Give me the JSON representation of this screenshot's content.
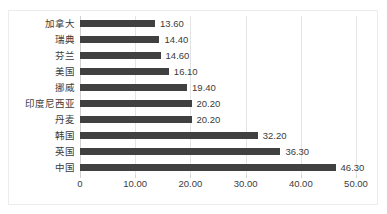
{
  "chart_data": {
    "type": "bar",
    "orientation": "horizontal",
    "title": "",
    "xlabel": "",
    "ylabel": "",
    "categories": [
      "加拿大",
      "瑞典",
      "芬兰",
      "美国",
      "挪威",
      "印度尼西亚",
      "丹麦",
      "韩国",
      "英国",
      "中国"
    ],
    "values": [
      13.6,
      14.4,
      14.6,
      16.1,
      19.4,
      20.2,
      20.2,
      32.2,
      36.3,
      46.3
    ],
    "value_labels": [
      "13.60",
      "14.40",
      "14.60",
      "16.10",
      "19.40",
      "20.20",
      "20.20",
      "32.20",
      "36.30",
      "46.30"
    ],
    "xlim": [
      0,
      50
    ],
    "xticks": [
      0,
      10,
      20,
      30,
      40,
      50
    ],
    "xtick_labels": [
      "0",
      "10.00",
      "20.00",
      "30.00",
      "40.00",
      "50.00"
    ],
    "grid": true,
    "legend": "none",
    "bar_color": "#404040",
    "gridline_color": "#e4e4e5",
    "background_color": "#ffffff",
    "border_color": "#ececed",
    "text_color": "#3b3b3b"
  }
}
